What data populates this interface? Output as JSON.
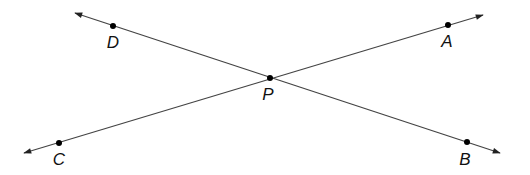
{
  "diagram": {
    "colors": {
      "line": "#444444",
      "point": "#000000",
      "label": "#111111",
      "background": "#ffffff"
    },
    "lines": [
      {
        "name": "line-DB",
        "from": [
          75,
          13
        ],
        "to": [
          500,
          153
        ],
        "arrows": "both"
      },
      {
        "name": "line-CA",
        "from": [
          24,
          153
        ],
        "to": [
          483,
          15
        ],
        "arrows": "both"
      }
    ],
    "points": [
      {
        "id": "D",
        "label": "D",
        "x": 113,
        "y": 26,
        "lx": 113,
        "ly": 48
      },
      {
        "id": "A",
        "label": "A",
        "x": 448,
        "y": 25,
        "lx": 447,
        "ly": 47
      },
      {
        "id": "P",
        "label": "P",
        "x": 270,
        "y": 78,
        "lx": 268,
        "ly": 100
      },
      {
        "id": "C",
        "label": "C",
        "x": 59,
        "y": 143,
        "lx": 59,
        "ly": 165
      },
      {
        "id": "B",
        "label": "B",
        "x": 467,
        "y": 142,
        "lx": 465,
        "ly": 165
      }
    ]
  }
}
